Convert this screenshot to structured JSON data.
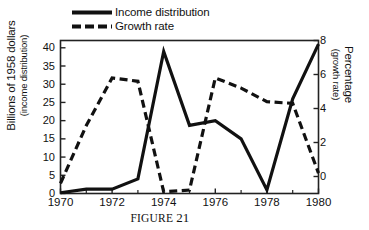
{
  "caption": {
    "word": "FIGURE",
    "number": "21"
  },
  "legend": {
    "position": "top-left",
    "items": [
      {
        "label": "Income distribution",
        "style": "solid",
        "swatch": "solid-line-swatch"
      },
      {
        "label": "Growth rate",
        "style": "dashed",
        "swatch": "dashed-line-swatch"
      }
    ]
  },
  "colors": {
    "line": "#111111",
    "axis": "#222222",
    "background": "#ffffff"
  },
  "chart_data": {
    "type": "line",
    "title": "",
    "xlabel": "",
    "ylabel": "Billions of 1958 dollars (income distribution)",
    "y2label": "Percentage (growth rate)",
    "grid": false,
    "x": [
      1970,
      1971,
      1972,
      1973,
      1974,
      1975,
      1976,
      1977,
      1978,
      1979,
      1980
    ],
    "xlim": [
      1970,
      1980
    ],
    "xticks": [
      1970,
      1972,
      1974,
      1976,
      1978,
      1980
    ],
    "xtick_labels": [
      "1970",
      "1972",
      "1974",
      "1976",
      "1978",
      "1980"
    ],
    "ylim": [
      0,
      42
    ],
    "yticks": [
      0,
      5,
      10,
      15,
      20,
      25,
      30,
      35,
      40
    ],
    "ytick_labels": [
      "0",
      "5",
      "10",
      "15",
      "20",
      "25",
      "30",
      "35",
      "40"
    ],
    "y2lim": [
      -1,
      8
    ],
    "y2ticks": [
      0,
      2,
      4,
      6,
      8
    ],
    "y2tick_labels": [
      "0",
      "2",
      "4",
      "6",
      "8"
    ],
    "series": [
      {
        "name": "Income distribution",
        "axis": "left",
        "style": "solid",
        "unit": "Billions of 1958 dollars",
        "values": [
          0.2,
          1.2,
          1.2,
          4.0,
          39.0,
          18.7,
          20.0,
          15.0,
          1.0,
          26.0,
          41.0
        ]
      },
      {
        "name": "Growth rate",
        "axis": "right",
        "style": "dashed",
        "unit": "Percentage",
        "values": [
          -0.4,
          3.0,
          5.8,
          5.6,
          -0.9,
          -0.8,
          5.8,
          5.2,
          4.4,
          4.3,
          0.2
        ]
      }
    ]
  }
}
